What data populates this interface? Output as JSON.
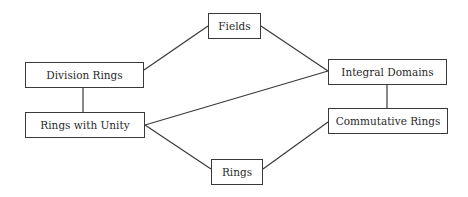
{
  "diagram": {
    "type": "hasse-diagram",
    "nodes": [
      {
        "id": "fields",
        "label": "Fields",
        "x": 208,
        "y": 13,
        "w": 53,
        "h": 26
      },
      {
        "id": "division-rings",
        "label": "Division Rings",
        "x": 25,
        "y": 62,
        "w": 119,
        "h": 26
      },
      {
        "id": "integral-domains",
        "label": "Integral Domains",
        "x": 328,
        "y": 59,
        "w": 119,
        "h": 26
      },
      {
        "id": "rings-with-unity",
        "label": "Rings with Unity",
        "x": 25,
        "y": 112,
        "w": 120,
        "h": 26
      },
      {
        "id": "commutative-rings",
        "label": "Commutative Rings",
        "x": 328,
        "y": 108,
        "w": 120,
        "h": 26
      },
      {
        "id": "rings",
        "label": "Rings",
        "x": 211,
        "y": 159,
        "w": 52,
        "h": 26
      }
    ],
    "edges": [
      {
        "from": "division-rings",
        "to": "fields",
        "x1": 144,
        "y1": 70,
        "x2": 208,
        "y2": 26
      },
      {
        "from": "fields",
        "to": "integral-domains",
        "x1": 261,
        "y1": 26,
        "x2": 328,
        "y2": 71
      },
      {
        "from": "rings-with-unity",
        "to": "integral-domains",
        "x1": 145,
        "y1": 125,
        "x2": 328,
        "y2": 71
      },
      {
        "from": "rings-with-unity",
        "to": "division-rings",
        "x1": 83,
        "y1": 112,
        "x2": 83,
        "y2": 88
      },
      {
        "from": "commutative-rings",
        "to": "integral-domains",
        "x1": 387,
        "y1": 108,
        "x2": 387,
        "y2": 85
      },
      {
        "from": "rings",
        "to": "rings-with-unity",
        "x1": 211,
        "y1": 169,
        "x2": 145,
        "y2": 125
      },
      {
        "from": "rings",
        "to": "commutative-rings",
        "x1": 263,
        "y1": 169,
        "x2": 328,
        "y2": 122
      }
    ],
    "colors": {
      "line": "#3a3a3a",
      "text": "#2a2a2a",
      "background": "#ffffff"
    }
  }
}
